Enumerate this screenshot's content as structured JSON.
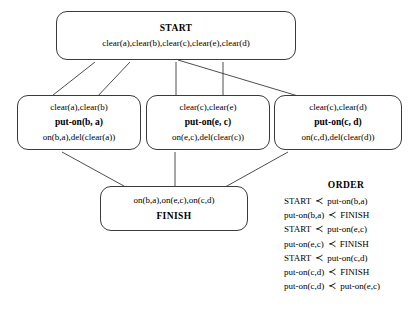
{
  "diagram": {
    "nodes": {
      "start": {
        "title": "START",
        "effects": "clear(a),clear(b),clear(c),clear(e),clear(d)"
      },
      "op_b_a": {
        "preconditions": "clear(a),clear(b)",
        "action": "put-on(b, a)",
        "effects": "on(b,a),del(clear(a))"
      },
      "op_e_c": {
        "preconditions": "clear(c),clear(e)",
        "action": "put-on(e, c)",
        "effects": "on(e,c),del(clear(c))"
      },
      "op_c_d": {
        "preconditions": "clear(c),clear(d)",
        "action": "put-on(c, d)",
        "effects": "on(c,d),del(clear(d))"
      },
      "finish": {
        "goals": "on(b,a),on(e,c),on(c,d)",
        "title": "FINISH"
      }
    }
  },
  "order": {
    "title": "ORDER",
    "operator": "≺",
    "constraints": [
      {
        "left": "START",
        "right": "put-on(b,a)"
      },
      {
        "left": "put-on(b,a)",
        "right": "FINISH"
      },
      {
        "left": "START",
        "right": "put-on(e,c)"
      },
      {
        "left": "put-on(e,c)",
        "right": "FINISH"
      },
      {
        "left": "START",
        "right": "put-on(c,d)"
      },
      {
        "left": "put-on(c,d)",
        "right": "FINISH"
      },
      {
        "left": "put-on(c,d)",
        "right": "put-on(e,c)"
      }
    ]
  }
}
